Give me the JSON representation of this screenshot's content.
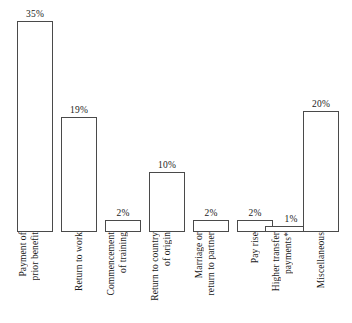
{
  "chart_data": {
    "type": "bar",
    "title": "",
    "subtitle": "",
    "xlabel": "",
    "ylabel": "",
    "ylim": [
      0,
      35
    ],
    "grid": false,
    "legend": "none",
    "orientation": "vertical",
    "categories": [
      "Payment of prior benefit",
      "Return to work",
      "Commencement of training",
      "Return to country of origin",
      "Marriage or return to partner",
      "Pay rise",
      "Higher transfer payments*",
      "Miscellaneous"
    ],
    "category_lines": [
      [
        "Payment of",
        "prior benefit"
      ],
      [
        "Return to work"
      ],
      [
        "Commencement",
        "of training"
      ],
      [
        "Return to country",
        "of origin"
      ],
      [
        "Marriage or",
        "return to partner"
      ],
      [
        "Pay rise"
      ],
      [
        "Higher transfer",
        "payments*"
      ],
      [
        "Miscellaneous"
      ]
    ],
    "values": [
      35,
      19,
      2,
      10,
      2,
      2,
      1,
      20
    ],
    "value_labels": [
      "35%",
      "19%",
      "2%",
      "10%",
      "2%",
      "2%",
      "1%",
      "20%"
    ],
    "colors": {
      "bar_fill": "#ffffff",
      "bar_border": "#4a4a4a",
      "text": "#1a1a1a",
      "background": "#ffffff"
    }
  }
}
